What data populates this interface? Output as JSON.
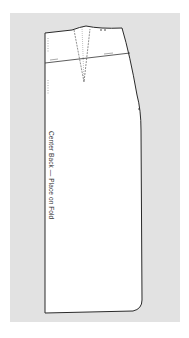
{
  "diagram": {
    "type": "sewing-pattern",
    "piece": "skirt-back",
    "label": "Center Back — Place on Fold",
    "colors": {
      "background": "#e2e2e2",
      "piece_fill": "#ffffff",
      "outline": "#2a2a2a",
      "marking": "#555555"
    }
  }
}
